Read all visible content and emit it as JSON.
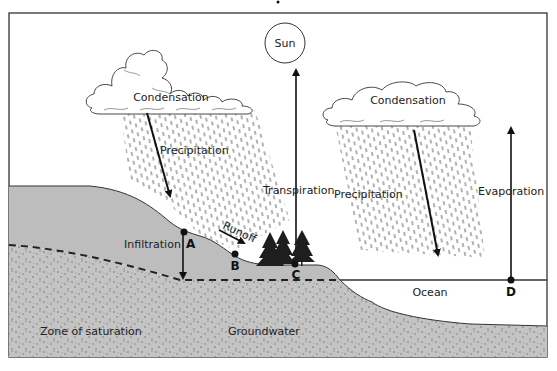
{
  "diagram": {
    "title": "",
    "colors": {
      "land": "#bdbdbd",
      "groundwater": "#c6c6c6",
      "outline": "#333333",
      "background": "#ffffff"
    },
    "labels": {
      "sun": "Sun",
      "condensation_left": "Condensation",
      "condensation_right": "Condensation",
      "precipitation_left": "Precipitation",
      "precipitation_right": "Precipitation",
      "transpiration": "Transpiration",
      "evaporation": "Evaporation",
      "infiltration": "Infiltration",
      "runoff": "Runoff",
      "ocean": "Ocean",
      "zone_of_saturation": "Zone of saturation",
      "groundwater": "Groundwater"
    },
    "points": [
      {
        "id": "A",
        "label": "A"
      },
      {
        "id": "B",
        "label": "B"
      },
      {
        "id": "C",
        "label": "C"
      },
      {
        "id": "D",
        "label": "D"
      }
    ]
  }
}
